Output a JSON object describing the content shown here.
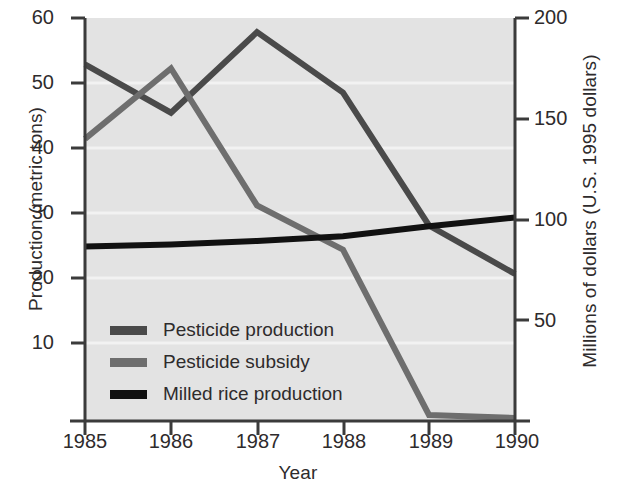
{
  "chart_data": {
    "type": "line",
    "title": "",
    "subtitle": "",
    "xlabel": "Year",
    "ylabel": "Production (metric tons)",
    "ylabel_right": "Millions of dollars (U.S. 1995 dollars)",
    "x": [
      1985,
      1986,
      1987,
      1988,
      1989,
      1990
    ],
    "categories": [
      "1985",
      "1986",
      "1987",
      "1988",
      "1989",
      "1990"
    ],
    "xlim": [
      1985,
      1990
    ],
    "ylim": [
      0,
      60
    ],
    "ylim_right": [
      0,
      200
    ],
    "yticks": [
      10,
      20,
      30,
      40,
      50,
      60
    ],
    "ytick_labels": [
      "10",
      "20",
      "30",
      "40",
      "50",
      "60"
    ],
    "yticks_right": [
      50,
      100,
      150,
      200
    ],
    "ytick_labels_right": [
      "50",
      "100",
      "150",
      "200"
    ],
    "xtick_labels": [
      "1985",
      "1986",
      "1987",
      "1988",
      "1989",
      "1990"
    ],
    "grid": "horizontal-light",
    "legend_position": "lower-left-inside",
    "plot_background": "#e3e3e3",
    "series": [
      {
        "name": "Pesticide production",
        "axis": "right",
        "color": "#4a4a4a",
        "values": [
          177,
          153,
          193,
          163,
          97,
          73
        ],
        "values_left_axis_equivalent": [
          53.1,
          45.9,
          57.9,
          48.9,
          29.1,
          21.9
        ]
      },
      {
        "name": "Pesticide subsidy",
        "axis": "right",
        "color": "#6e6e6e",
        "values": [
          140,
          175,
          107,
          85,
          3,
          1.5
        ],
        "values_left_axis_equivalent": [
          42.0,
          52.5,
          32.1,
          25.5,
          0.9,
          0.45
        ]
      },
      {
        "name": "Milled rice production",
        "axis": "left",
        "color": "#111111",
        "values": [
          26.0,
          26.3,
          26.8,
          27.5,
          29.0,
          30.3
        ]
      }
    ],
    "legend": [
      {
        "label": "Pesticide production",
        "color": "#4a4a4a"
      },
      {
        "label": "Pesticide subsidy",
        "color": "#6e6e6e"
      },
      {
        "label": "Milled rice production",
        "color": "#111111"
      }
    ]
  },
  "geometry": {
    "plot_left": 85,
    "plot_right": 515,
    "plot_top": 18,
    "plot_bottom": 421
  }
}
